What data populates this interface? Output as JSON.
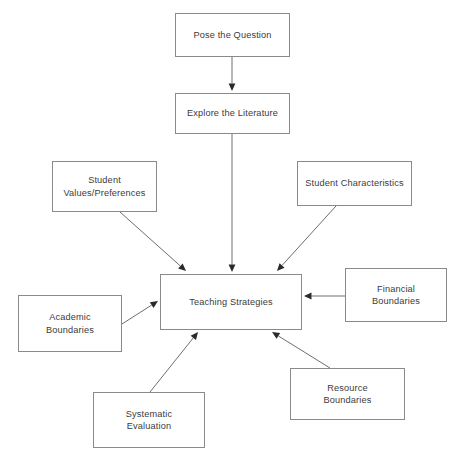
{
  "diagram": {
    "background_color": "#ffffff",
    "box_border_color": "#8a8a8a",
    "text_color": "#3b3b3b",
    "arrow_color": "#6e6e6e",
    "caption_partial": ""
  },
  "nodes": [
    {
      "id": "pose-the-question",
      "label": "Pose the Question",
      "x": 175,
      "y": 13,
      "w": 115,
      "h": 44
    },
    {
      "id": "explore-the-literature",
      "label": "Explore the Literature",
      "x": 175,
      "y": 93,
      "w": 115,
      "h": 41
    },
    {
      "id": "student-values-preferences",
      "label": "Student\nValues/Preferences",
      "x": 52,
      "y": 161,
      "w": 105,
      "h": 51
    },
    {
      "id": "student-characteristics",
      "label": "Student Characteristics",
      "x": 297,
      "y": 161,
      "w": 115,
      "h": 45
    },
    {
      "id": "teaching-strategies",
      "label": "Teaching Strategies",
      "x": 160,
      "y": 274,
      "w": 142,
      "h": 56
    },
    {
      "id": "academic-boundaries",
      "label": "Academic\nBoundaries",
      "x": 18,
      "y": 295,
      "w": 104,
      "h": 57
    },
    {
      "id": "financial-boundaries",
      "label": "Financial\nBoundaries",
      "x": 345,
      "y": 268,
      "w": 102,
      "h": 54
    },
    {
      "id": "systematic-evaluation",
      "label": "Systematic\nEvaluation",
      "x": 93,
      "y": 392,
      "w": 112,
      "h": 56
    },
    {
      "id": "resource-boundaries",
      "label": "Resource\nBoundaries",
      "x": 290,
      "y": 368,
      "w": 115,
      "h": 52
    }
  ],
  "edges": [
    {
      "id": "edge-pose-to-explore",
      "from": "pose-the-question",
      "to": "explore-the-literature",
      "x1": 232,
      "y1": 57,
      "x2": 232,
      "y2": 91
    },
    {
      "id": "edge-explore-to-teaching",
      "from": "explore-the-literature",
      "to": "teaching-strategies",
      "x1": 232,
      "y1": 134,
      "x2": 232,
      "y2": 272
    },
    {
      "id": "edge-values-to-teaching",
      "from": "student-values-preferences",
      "to": "teaching-strategies",
      "x1": 120,
      "y1": 212,
      "x2": 186,
      "y2": 271
    },
    {
      "id": "edge-characteristics-to-teaching",
      "from": "student-characteristics",
      "to": "teaching-strategies",
      "x1": 336,
      "y1": 206,
      "x2": 277,
      "y2": 271
    },
    {
      "id": "edge-academic-to-teaching",
      "from": "academic-boundaries",
      "to": "teaching-strategies",
      "x1": 122,
      "y1": 324,
      "x2": 158,
      "y2": 301
    },
    {
      "id": "edge-financial-to-teaching",
      "from": "financial-boundaries",
      "to": "teaching-strategies",
      "x1": 345,
      "y1": 296,
      "x2": 304,
      "y2": 296
    },
    {
      "id": "edge-systematic-to-teaching",
      "from": "systematic-evaluation",
      "to": "teaching-strategies",
      "x1": 150,
      "y1": 392,
      "x2": 198,
      "y2": 332
    },
    {
      "id": "edge-resource-to-teaching",
      "from": "resource-boundaries",
      "to": "teaching-strategies",
      "x1": 330,
      "y1": 368,
      "x2": 272,
      "y2": 332
    }
  ]
}
